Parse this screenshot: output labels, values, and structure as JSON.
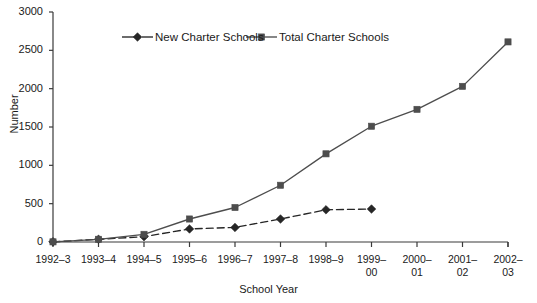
{
  "chart_data": {
    "type": "line",
    "title": "",
    "xlabel": "School Year",
    "ylabel": "Number",
    "categories": [
      "1992–3",
      "1993–4",
      "1994–5",
      "1995–6",
      "1996–7",
      "1997–8",
      "1998–9",
      "1999–00",
      "2000–01",
      "2001–02",
      "2002–03"
    ],
    "category_lines": [
      [
        "1992–3",
        ""
      ],
      [
        "1993–4",
        ""
      ],
      [
        "1994–5",
        ""
      ],
      [
        "1995–6",
        ""
      ],
      [
        "1996–7",
        ""
      ],
      [
        "1997–8",
        ""
      ],
      [
        "1998–9",
        ""
      ],
      [
        "1999–",
        "00"
      ],
      [
        "2000–",
        "01"
      ],
      [
        "2001–",
        "02"
      ],
      [
        "2002–",
        "03"
      ]
    ],
    "ylim": [
      0,
      3000
    ],
    "yticks": [
      0,
      500,
      1000,
      1500,
      2000,
      2500,
      3000
    ],
    "ytick_labels": [
      "0",
      "500",
      "1000",
      "1500",
      "2000",
      "2500",
      "3000"
    ],
    "grid": false,
    "legend_position": "top-center",
    "series": [
      {
        "name": "New Charter Schools",
        "marker": "diamond",
        "line_style": "dashed",
        "color": "#262626",
        "values": [
          2,
          35,
          70,
          170,
          190,
          300,
          420,
          430,
          null,
          null,
          null
        ]
      },
      {
        "name": "Total Charter Schools",
        "marker": "square",
        "line_style": "solid",
        "color": "#4d4d4d",
        "values": [
          2,
          35,
          100,
          300,
          450,
          740,
          1150,
          1510,
          1730,
          2030,
          2610
        ]
      }
    ]
  },
  "legend": {
    "items": [
      {
        "label": "New Charter Schools"
      },
      {
        "label": "Total Charter Schools"
      }
    ]
  }
}
